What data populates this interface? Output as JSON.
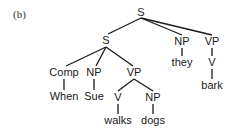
{
  "caption": "(b)",
  "tree": {
    "nodes": [
      {
        "id": "s_root",
        "label": "S",
        "x": 141,
        "y": 7
      },
      {
        "id": "s_sub",
        "label": "S",
        "x": 106,
        "y": 35
      },
      {
        "id": "np_they",
        "label": "NP",
        "x": 182,
        "y": 36
      },
      {
        "id": "vp_bark",
        "label": "VP",
        "x": 212,
        "y": 36
      },
      {
        "id": "comp",
        "label": "Comp",
        "x": 64,
        "y": 67
      },
      {
        "id": "np_sue",
        "label": "NP",
        "x": 94,
        "y": 67
      },
      {
        "id": "vp_walks",
        "label": "VP",
        "x": 134,
        "y": 67
      },
      {
        "id": "w_when",
        "label": "When",
        "x": 64,
        "y": 91
      },
      {
        "id": "w_sue",
        "label": "Sue",
        "x": 94,
        "y": 91
      },
      {
        "id": "v_walks",
        "label": "V",
        "x": 118,
        "y": 92
      },
      {
        "id": "np_dogs",
        "label": "NP",
        "x": 153,
        "y": 92
      },
      {
        "id": "w_walks",
        "label": "walks",
        "x": 118,
        "y": 115
      },
      {
        "id": "w_dogs",
        "label": "dogs",
        "x": 153,
        "y": 115
      },
      {
        "id": "w_they",
        "label": "they",
        "x": 182,
        "y": 57
      },
      {
        "id": "v_bark",
        "label": "V",
        "x": 212,
        "y": 57
      },
      {
        "id": "w_bark",
        "label": "bark",
        "x": 212,
        "y": 80
      }
    ],
    "edges": [
      [
        141,
        18,
        108,
        34
      ],
      [
        141,
        18,
        182,
        35
      ],
      [
        141,
        18,
        212,
        35
      ],
      [
        106,
        47,
        66,
        66
      ],
      [
        106,
        47,
        96,
        66
      ],
      [
        106,
        47,
        133,
        66
      ],
      [
        64,
        79,
        64,
        90
      ],
      [
        94,
        79,
        94,
        90
      ],
      [
        134,
        79,
        118,
        91
      ],
      [
        134,
        79,
        153,
        91
      ],
      [
        118,
        104,
        118,
        114
      ],
      [
        153,
        104,
        153,
        114
      ],
      [
        182,
        48,
        182,
        56
      ],
      [
        212,
        48,
        212,
        56
      ],
      [
        212,
        69,
        212,
        79
      ]
    ]
  }
}
